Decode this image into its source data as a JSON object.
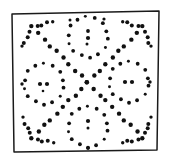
{
  "figure": {
    "ink_color": "#111111",
    "frame_color": "#1a1a1a",
    "background_color": "#ffffff",
    "canvas": {
      "width": 172,
      "height": 164
    }
  },
  "frame": {
    "name": "hand-drawn-square-border",
    "stroke_width": 1.5,
    "points": "12,14 159,11 157,150 14,152 12,14"
  },
  "motif": {
    "rings": [
      {
        "name": "top-ring",
        "cx": 88,
        "cy": 37,
        "r": 20,
        "dot_count": 14,
        "start_angle": -96,
        "dot_radius": 1.9,
        "center_dots": [
          {
            "x": 88,
            "y": 31,
            "r": 1.9
          },
          {
            "x": 88,
            "y": 38,
            "r": 2.1
          },
          {
            "x": 87,
            "y": 44,
            "r": 1.5
          }
        ]
      },
      {
        "name": "left-ring",
        "cx": 44,
        "cy": 84,
        "r": 20,
        "dot_count": 14,
        "start_angle": -90,
        "dot_radius": 1.9,
        "center_dots": [
          {
            "x": 40,
            "y": 84,
            "r": 2.1
          },
          {
            "x": 47,
            "y": 84,
            "r": 2.1
          },
          {
            "x": 43,
            "y": 91,
            "r": 1.3
          }
        ]
      },
      {
        "name": "right-ring",
        "cx": 129,
        "cy": 82,
        "r": 20,
        "dot_count": 14,
        "start_angle": -90,
        "dot_radius": 1.9,
        "center_dots": [
          {
            "x": 125,
            "y": 82,
            "r": 2.1
          },
          {
            "x": 132,
            "y": 82,
            "r": 2.1
          }
        ]
      },
      {
        "name": "bottom-ring",
        "cx": 88,
        "cy": 127,
        "r": 20,
        "dot_count": 14,
        "start_angle": -90,
        "dot_radius": 1.9,
        "center_dots": [
          {
            "x": 88,
            "y": 121,
            "r": 2.1
          },
          {
            "x": 88,
            "y": 128,
            "r": 1.5
          }
        ]
      }
    ],
    "diagonals": [
      {
        "name": "diagonal-nw-se",
        "from": {
          "x": 32,
          "y": 27
        },
        "to": {
          "x": 143,
          "y": 138
        },
        "dot_count": 19,
        "dot_radius": 2.2
      },
      {
        "name": "diagonal-ne-sw",
        "from": {
          "x": 143,
          "y": 27
        },
        "to": {
          "x": 32,
          "y": 138
        },
        "dot_count": 19,
        "dot_radius": 2.2
      }
    ],
    "corner_branches": [
      {
        "name": "corner-branch-top-left",
        "apex": {
          "x": 32,
          "y": 27
        },
        "arm_a": {
          "x": 22,
          "y": 47
        },
        "arm_b": {
          "x": 52,
          "y": 22
        },
        "dots_per_arm": 4,
        "dot_radius": 2.0
      },
      {
        "name": "corner-branch-top-right",
        "apex": {
          "x": 143,
          "y": 27
        },
        "arm_a": {
          "x": 151,
          "y": 47
        },
        "arm_b": {
          "x": 122,
          "y": 22
        },
        "dots_per_arm": 4,
        "dot_radius": 2.0
      },
      {
        "name": "corner-branch-bottom-left",
        "apex": {
          "x": 32,
          "y": 138
        },
        "arm_a": {
          "x": 23,
          "y": 118
        },
        "arm_b": {
          "x": 53,
          "y": 143
        },
        "dots_per_arm": 4,
        "dot_radius": 2.0
      },
      {
        "name": "corner-branch-bottom-right",
        "apex": {
          "x": 143,
          "y": 138
        },
        "arm_a": {
          "x": 151,
          "y": 118
        },
        "arm_b": {
          "x": 122,
          "y": 143
        },
        "dots_per_arm": 4,
        "dot_radius": 2.0
      }
    ],
    "loose_dots": [
      {
        "name": "loose-dot-top-gap-left",
        "x": 70,
        "y": 20,
        "r": 1.5
      },
      {
        "name": "loose-dot-top-gap-right",
        "x": 104,
        "y": 19,
        "r": 1.6
      },
      {
        "name": "loose-dot-bottom-gap",
        "x": 88,
        "y": 148,
        "r": 1.8
      },
      {
        "name": "loose-dot-left-gap",
        "x": 22,
        "y": 84,
        "r": 1.7
      },
      {
        "name": "loose-dot-right-gap",
        "x": 150,
        "y": 82,
        "r": 1.7
      }
    ]
  }
}
